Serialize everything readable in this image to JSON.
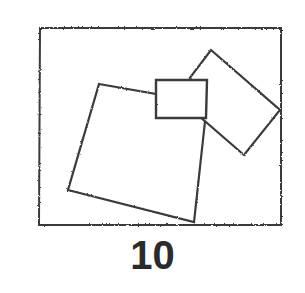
{
  "figure": {
    "caption": "10",
    "ink_color": "#3a3a3a",
    "background_color": "#ffffff",
    "border": {
      "name": "outer-frame",
      "points": "40,28 281,28 281,225 39,225",
      "stroke_width": 2.0
    },
    "shapes": [
      {
        "name": "large-tilted-square",
        "points": "99,84 207,103 194,222 68,190",
        "stroke_width": 2.2
      },
      {
        "name": "tilted-rectangle-right",
        "points": "211,50 280,110 244,155 176,96",
        "stroke_width": 2.2
      },
      {
        "name": "small-rectangle-center",
        "points": "156,80 207,80 206,118 156,118",
        "stroke_width": 2.4
      }
    ]
  }
}
